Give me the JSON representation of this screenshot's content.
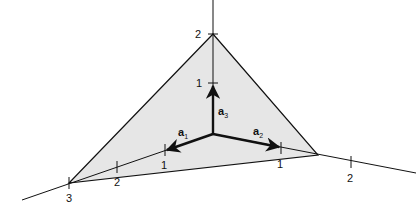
{
  "diagram": {
    "colors": {
      "plane_fill": "#e6e6e6",
      "line": "#111111"
    },
    "vectors": [
      {
        "name": "a",
        "sub": "1"
      },
      {
        "name": "a",
        "sub": "2"
      },
      {
        "name": "a",
        "sub": "3"
      }
    ],
    "ticks": {
      "a3": [
        "1",
        "2"
      ],
      "a1": [
        "1",
        "2",
        "3"
      ],
      "a2": [
        "1",
        "2"
      ]
    }
  }
}
